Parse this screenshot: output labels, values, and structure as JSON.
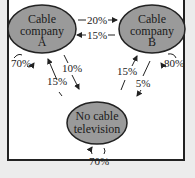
{
  "diagram": {
    "type": "markov-transition-diagram",
    "colors": {
      "node_fill": "#9a9a9a",
      "node_stroke": "#222222",
      "background": "#ffffff",
      "outer": "#ececec"
    },
    "nodes": [
      {
        "id": "A",
        "lines": [
          "Cable",
          "company",
          "A"
        ]
      },
      {
        "id": "B",
        "lines": [
          "Cable",
          "company",
          "B"
        ]
      },
      {
        "id": "N",
        "lines": [
          "No cable",
          "television"
        ]
      }
    ],
    "edges": [
      {
        "from": "A",
        "to": "B",
        "label": "20%"
      },
      {
        "from": "B",
        "to": "A",
        "label": "15%"
      },
      {
        "from": "A",
        "to": "A",
        "label": "70%"
      },
      {
        "from": "B",
        "to": "B",
        "label": "80%"
      },
      {
        "from": "A",
        "to": "N",
        "label": "10%"
      },
      {
        "from": "N",
        "to": "A",
        "label": "15%"
      },
      {
        "from": "N",
        "to": "B",
        "label": "15%"
      },
      {
        "from": "B",
        "to": "N",
        "label": "5%"
      },
      {
        "from": "N",
        "to": "N",
        "label": "70%"
      }
    ]
  }
}
